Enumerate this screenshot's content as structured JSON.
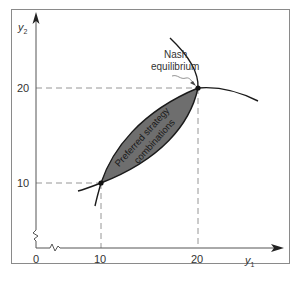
{
  "diagram": {
    "axes": {
      "x_label": "y",
      "x_subscript": "1",
      "y_label": "y",
      "y_subscript": "2",
      "origin_label": "0",
      "x_ticks": [
        "10",
        "20"
      ],
      "y_ticks": [
        "10",
        "20"
      ],
      "axis_break": true
    },
    "annotations": {
      "nash_line1": "Nash",
      "nash_line2": "equilibrium",
      "region_line1": "Preferred strategy",
      "region_line2": "combinations"
    },
    "points": [
      {
        "name": "nash-equilibrium-point",
        "x": 20,
        "y": 20
      },
      {
        "name": "lower-intersection-point",
        "x": 10,
        "y": 10
      }
    ],
    "colors": {
      "region_fill": "#6e6e6e",
      "curve": "#1a1a1a",
      "frame": "#8a8a8a",
      "dashed": "#8a8a8a"
    }
  }
}
